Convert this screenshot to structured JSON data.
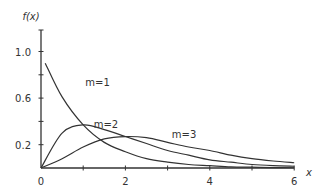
{
  "chart_data": {
    "type": "line",
    "title": "",
    "xlabel": "x",
    "ylabel": "f(x)",
    "xlim": [
      0,
      6
    ],
    "ylim": [
      0,
      1.2
    ],
    "xticks": [
      0,
      1,
      2,
      3,
      4,
      5,
      6
    ],
    "xtick_labels": [
      "0",
      "",
      "2",
      "",
      "4",
      "",
      "6"
    ],
    "yticks": [
      0,
      0.2,
      0.4,
      0.6,
      0.8,
      1.0
    ],
    "ytick_labels": [
      "",
      "0.2",
      "",
      "0.6",
      "",
      "1.0"
    ],
    "grid": false,
    "legend": "inline labels",
    "series": [
      {
        "name": "m=1",
        "label_pos": [
          1.05,
          0.74
        ],
        "x": [
          0.1,
          0.5,
          1,
          1.5,
          2,
          2.5,
          3,
          3.5,
          4,
          4.5,
          5,
          5.5,
          6
        ],
        "values": [
          0.9,
          0.61,
          0.37,
          0.22,
          0.14,
          0.08,
          0.05,
          0.03,
          0.02,
          0.01,
          0.007,
          0.004,
          0.002
        ]
      },
      {
        "name": "m=2",
        "label_pos": [
          1.25,
          0.38
        ],
        "x": [
          0,
          0.5,
          1,
          1.5,
          2,
          2.5,
          3,
          3.5,
          4,
          4.5,
          5,
          5.5,
          6
        ],
        "values": [
          0,
          0.3,
          0.37,
          0.33,
          0.27,
          0.21,
          0.15,
          0.11,
          0.07,
          0.05,
          0.03,
          0.02,
          0.015
        ]
      },
      {
        "name": "m=3",
        "label_pos": [
          3.1,
          0.29
        ],
        "x": [
          0,
          0.5,
          1,
          1.5,
          2,
          2.5,
          3,
          3.5,
          4,
          4.5,
          5,
          5.5,
          6
        ],
        "values": [
          0,
          0.08,
          0.18,
          0.25,
          0.27,
          0.26,
          0.22,
          0.18,
          0.15,
          0.11,
          0.08,
          0.06,
          0.045
        ]
      }
    ]
  }
}
